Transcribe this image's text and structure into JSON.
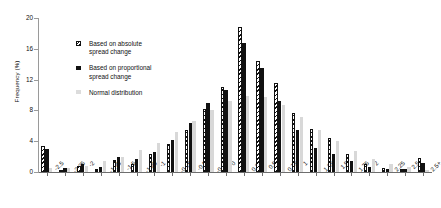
{
  "chart_data": {
    "type": "bar",
    "title": "",
    "xlabel": "",
    "ylabel": "Frequency (%)",
    "ylim": [
      0,
      20
    ],
    "yticks": [
      0,
      4,
      8,
      12,
      16,
      20
    ],
    "grid": false,
    "legend_position": "upper-left-inside",
    "categories": [
      "-2.5",
      "-2.25",
      "-2",
      "-1.75",
      "-1.5",
      "-1.25",
      "-1",
      "-0.75",
      "-0.5",
      "-0.25",
      "0",
      "0.25",
      "0.5",
      "0.75",
      "1",
      "1.25",
      "1.5",
      "1.75",
      "2",
      "2.25",
      "2.5",
      "2.5+"
    ],
    "series": [
      {
        "name": "Based on absolute spread change",
        "style": "hatched",
        "values": [
          3.4,
          0.3,
          0.8,
          0.4,
          1.6,
          1.0,
          2.4,
          3.6,
          5.5,
          8.2,
          11.0,
          18.8,
          14.4,
          11.6,
          7.6,
          5.6,
          4.4,
          2.3,
          1.0,
          0.5,
          0.4,
          1.8
        ]
      },
      {
        "name": "Based on proportional spread change",
        "style": "solid-black",
        "values": [
          3.0,
          0.5,
          1.1,
          0.6,
          1.9,
          1.7,
          2.6,
          4.2,
          6.4,
          9.0,
          10.6,
          16.8,
          13.5,
          9.2,
          5.4,
          3.1,
          2.4,
          1.4,
          0.6,
          0.4,
          0.4,
          1.2
        ]
      },
      {
        "name": "Normal distribution",
        "style": "light-grey",
        "values": [
          0.5,
          0.5,
          0.8,
          1.4,
          2.0,
          2.8,
          3.8,
          5.2,
          6.6,
          8.0,
          9.2,
          9.9,
          9.7,
          8.7,
          7.2,
          5.5,
          4.0,
          2.7,
          1.7,
          1.0,
          0.6,
          0.3
        ]
      }
    ]
  },
  "axis": {
    "ylabel": "Frequency (%)"
  },
  "legend": {
    "items": [
      {
        "line1": "Based on absolute",
        "line2": "spread change",
        "swatch": "hatched-square-icon"
      },
      {
        "line1": "Based on proportional",
        "line2": "spread change",
        "swatch": "filled-square-icon"
      },
      {
        "line1": "Normal distribution",
        "line2": "",
        "swatch": "grey-square-icon"
      }
    ]
  }
}
